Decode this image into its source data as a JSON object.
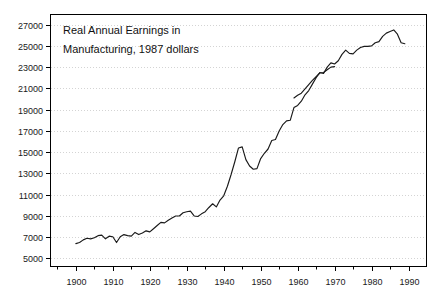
{
  "chart_data": {
    "type": "line",
    "title": "Real Annual Earnings in Manufacturing, 1987 dollars",
    "title_line1": "Real Annual Earnings in",
    "title_line2": "Manufacturing, 1987 dollars",
    "xlabel": "",
    "ylabel": "",
    "xlim": [
      1893,
      1995
    ],
    "ylim": [
      4200,
      28000
    ],
    "grid": true,
    "legend_position": "none",
    "y_ticks": [
      5000,
      7000,
      9000,
      11000,
      13000,
      15000,
      17000,
      19000,
      21000,
      23000,
      25000,
      27000
    ],
    "y_tick_labels": [
      "5000",
      "7000",
      "9000",
      "11000",
      "13000",
      "15000",
      "17000",
      "19000",
      "21000",
      "23000",
      "25000",
      "27000"
    ],
    "x_ticks": [
      1900,
      1910,
      1920,
      1930,
      1940,
      1950,
      1960,
      1970,
      1980,
      1990
    ],
    "x_tick_labels": [
      "1900",
      "1910",
      "1920",
      "1930",
      "1940",
      "1950",
      "1960",
      "1970",
      "1980",
      "1990"
    ],
    "x_minor_ticks": [
      1895,
      1905,
      1915,
      1925,
      1935,
      1945,
      1955,
      1965,
      1975,
      1985
    ],
    "line_color": "#1a1a1a",
    "series": [
      {
        "name": "Real annual earnings in manufacturing (main series)",
        "x": [
          1900,
          1901,
          1902,
          1903,
          1904,
          1905,
          1906,
          1907,
          1908,
          1909,
          1910,
          1911,
          1912,
          1913,
          1914,
          1915,
          1916,
          1917,
          1918,
          1919,
          1920,
          1921,
          1922,
          1923,
          1924,
          1925,
          1926,
          1927,
          1928,
          1929,
          1930,
          1931,
          1932,
          1933,
          1934,
          1935,
          1936,
          1937,
          1938,
          1939,
          1940,
          1941,
          1942,
          1943,
          1944,
          1945,
          1946,
          1947,
          1948,
          1949,
          1950,
          1951,
          1952,
          1953,
          1954,
          1955,
          1956,
          1957,
          1958,
          1959,
          1960,
          1961,
          1962,
          1963,
          1964,
          1965,
          1966,
          1967,
          1968,
          1969,
          1970,
          1971,
          1972,
          1973,
          1974,
          1975,
          1976,
          1977,
          1978,
          1979,
          1980,
          1981,
          1982,
          1983,
          1984,
          1985,
          1986,
          1987,
          1988,
          1989
        ],
        "values": [
          6400,
          6500,
          6750,
          6900,
          6850,
          6950,
          7150,
          7200,
          6850,
          7100,
          7050,
          6500,
          7050,
          7250,
          7150,
          7100,
          7450,
          7250,
          7400,
          7600,
          7500,
          7800,
          8100,
          8400,
          8350,
          8600,
          8800,
          9000,
          9000,
          9300,
          9400,
          9450,
          9000,
          8950,
          9200,
          9400,
          9800,
          10150,
          9850,
          10500,
          10900,
          11800,
          12900,
          14100,
          15400,
          15500,
          14300,
          13700,
          13400,
          13450,
          14400,
          14900,
          15300,
          16100,
          16200,
          17000,
          17600,
          17950,
          18000,
          19200,
          19400,
          19800,
          20400,
          20800,
          21400,
          22000,
          22500,
          22400,
          23000,
          23400,
          23300,
          23600,
          24200,
          24600,
          24300,
          24250,
          24600,
          24850,
          24950,
          24950,
          25000,
          25300,
          25400,
          25900,
          26200,
          26350,
          26500,
          26100,
          25300,
          25200
        ]
      },
      {
        "name": "Real annual earnings in manufacturing (alternate series)",
        "x": [
          1959,
          1960,
          1961,
          1962,
          1963,
          1964,
          1965,
          1966,
          1967,
          1968,
          1969,
          1970
        ],
        "values": [
          20100,
          20350,
          20550,
          20950,
          21350,
          21750,
          22100,
          22450,
          22500,
          22750,
          23000,
          23050
        ]
      }
    ]
  },
  "plot": {
    "frame": {
      "left": 50,
      "top": 14,
      "right": 427,
      "bottom": 267
    }
  }
}
